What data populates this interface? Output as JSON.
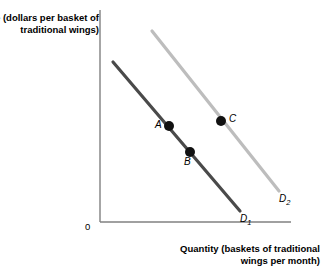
{
  "chart_data": {
    "type": "line",
    "title": "",
    "xlabel": "Quantity (baskets of traditional wings per month)",
    "ylabel": "Price (dollars per basket of traditional wings)",
    "origin_label": "0",
    "grid": false,
    "legend": "inline-curve-labels",
    "axis_ranges": {
      "x": [
        0,
        100
      ],
      "y": [
        0,
        100
      ]
    },
    "axis_ticks": {
      "x": [],
      "y": []
    },
    "series": [
      {
        "name": "D1",
        "label": "D",
        "label_sub": "1",
        "color": "#4a4a4a",
        "description": "original demand curve",
        "x": [
          8,
          72
        ],
        "y": [
          87,
          8
        ],
        "pixel_start": {
          "x": 113,
          "y": 62
        },
        "pixel_end": {
          "x": 240,
          "y": 211
        },
        "label_pos": {
          "x": 240,
          "y": 215
        }
      },
      {
        "name": "D2",
        "label": "D",
        "label_sub": "2",
        "color": "#bdbdbd",
        "description": "demand curve after rightward shift",
        "x": [
          28,
          94
        ],
        "y": [
          100,
          17
        ],
        "pixel_start": {
          "x": 152,
          "y": 31
        },
        "pixel_end": {
          "x": 279,
          "y": 191
        },
        "label_pos": {
          "x": 279,
          "y": 195
        }
      }
    ],
    "points": [
      {
        "label": "A",
        "series": "D1",
        "pixel": {
          "x": 169,
          "y": 126
        },
        "label_pixel": {
          "x": 155,
          "y": 120
        },
        "label_side": "left"
      },
      {
        "label": "B",
        "series": "D1",
        "pixel": {
          "x": 190,
          "y": 152
        },
        "label_pixel": {
          "x": 184,
          "y": 156
        },
        "label_side": "below"
      },
      {
        "label": "C",
        "series": "D2",
        "pixel": {
          "x": 221,
          "y": 121
        },
        "label_pixel": {
          "x": 228,
          "y": 113
        },
        "label_side": "right"
      }
    ],
    "axes": {
      "color": "#808080",
      "y_axis": {
        "x": 100,
        "y_top": 10,
        "y_bottom": 222
      },
      "x_axis": {
        "y": 222,
        "x_left": 100,
        "x_right": 291
      }
    },
    "colors": {
      "background": "#ffffff",
      "text": "#000000",
      "axis": "#808080",
      "curve_primary": "#4a4a4a",
      "curve_secondary": "#bdbdbd",
      "point_fill": "#111111"
    }
  }
}
